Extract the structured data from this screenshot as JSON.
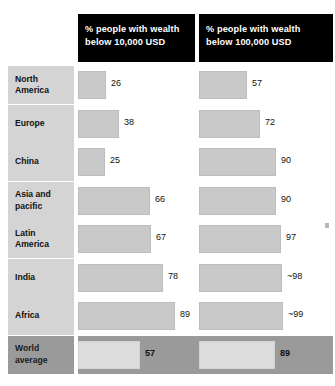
{
  "chart_data": {
    "type": "bar",
    "title": "",
    "subtitle": "",
    "xlabel": "",
    "ylabel": "",
    "xlim": [
      0,
      100
    ],
    "grid": false,
    "legend": "none",
    "orientation": "horizontal",
    "categories": [
      "North America",
      "Europe",
      "China",
      "Asia and pacific",
      "Latin America",
      "India",
      "Africa",
      "World average"
    ],
    "series": [
      {
        "name": "% people with wealth below 10,000 USD",
        "values": [
          26,
          38,
          25,
          66,
          67,
          78,
          89,
          57
        ],
        "labels": [
          "26",
          "38",
          "25",
          "66",
          "67",
          "78",
          "89",
          "57"
        ]
      },
      {
        "name": "% people with wealth below 100,000 USD",
        "values": [
          57,
          72,
          90,
          90,
          97,
          98,
          99,
          89
        ],
        "labels": [
          "57",
          "72",
          "90",
          "90",
          "97",
          "~98",
          "~99",
          "89"
        ]
      }
    ],
    "annotations": [
      "World average row is highlighted with a darker band"
    ]
  },
  "colors": {
    "header_background": "#000000",
    "header_text": "#ffffff",
    "label_background": "#d4d4d4",
    "bar_fill": "#c9c9c9",
    "highlight_band": "#9a9a9a",
    "highlight_bar_fill": "#dcdcdc",
    "page_background": "#ffffff",
    "value_text": "#111111"
  },
  "headers": [
    {
      "line1": "% people with wealth",
      "line2": "below 10,000 USD"
    },
    {
      "line1": "% people with wealth",
      "line2": "below 100,000 USD"
    }
  ],
  "rows": [
    {
      "label_line1": "North",
      "label_line2": "America",
      "col1_value": "26",
      "col2_value": "57",
      "col1_width": 26,
      "col2_width": 57,
      "highlight": false
    },
    {
      "label_line1": "Europe",
      "label_line2": "",
      "col1_value": "38",
      "col2_value": "72",
      "col1_width": 38,
      "col2_width": 72,
      "highlight": false
    },
    {
      "label_line1": "China",
      "label_line2": "",
      "col1_value": "25",
      "col2_value": "90",
      "col1_width": 25,
      "col2_width": 90,
      "highlight": false
    },
    {
      "label_line1": "Asia and",
      "label_line2": "pacific",
      "col1_value": "66",
      "col2_value": "90",
      "col1_width": 66,
      "col2_width": 90,
      "highlight": false
    },
    {
      "label_line1": "Latin",
      "label_line2": "America",
      "col1_value": "67",
      "col2_value": "97",
      "col1_width": 67,
      "col2_width": 97,
      "highlight": false
    },
    {
      "label_line1": "India",
      "label_line2": "",
      "col1_value": "78",
      "col2_value": "~98",
      "col1_width": 78,
      "col2_width": 98,
      "highlight": false
    },
    {
      "label_line1": "Africa",
      "label_line2": "",
      "col1_value": "89",
      "col2_value": "~99",
      "col1_width": 89,
      "col2_width": 99,
      "highlight": false
    },
    {
      "label_line1": "World",
      "label_line2": "average",
      "col1_value": "57",
      "col2_value": "89",
      "col1_width": 57,
      "col2_width": 89,
      "highlight": true
    }
  ],
  "layout": {
    "row_top_start": 66,
    "row_pitch": 38.5,
    "row_height": 38,
    "col1_bar_left": 78,
    "col1_bar_max": 109,
    "col2_bar_left": 199,
    "col2_bar_max": 85
  }
}
